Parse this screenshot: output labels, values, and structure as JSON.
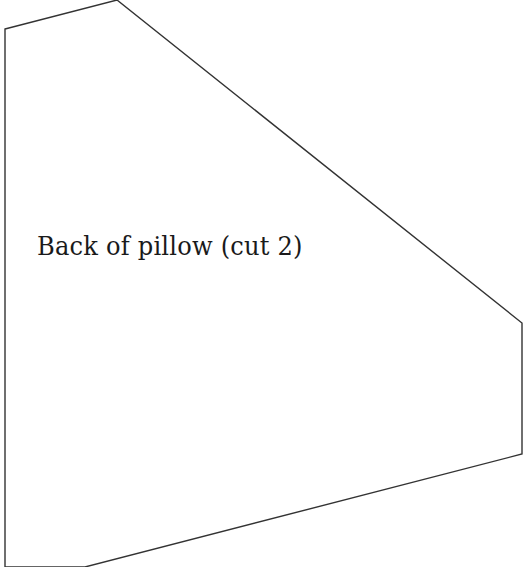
{
  "pattern_piece": {
    "label": "Back of pillow (cut 2)",
    "outline_color": "#333333",
    "fill_color": "#ffffff",
    "points": "5,29 117,0 522,323 522,454 85,567 5,567"
  }
}
